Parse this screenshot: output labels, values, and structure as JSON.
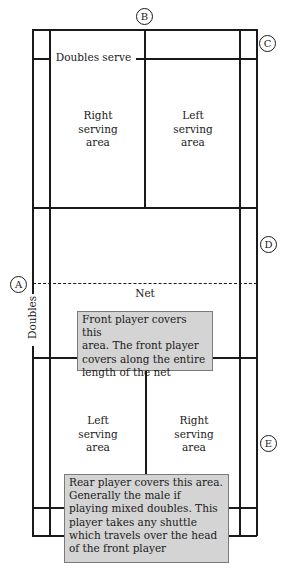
{
  "diagram": {
    "markers": [
      {
        "id": "A",
        "label": "A"
      },
      {
        "id": "B",
        "label": "B"
      },
      {
        "id": "C",
        "label": "C"
      },
      {
        "id": "D",
        "label": "D"
      },
      {
        "id": "E",
        "label": "E"
      }
    ],
    "labels": {
      "doubles_serve": "Doubles serve",
      "net": "Net",
      "doubles": "Doubles"
    },
    "top_half": {
      "right_area": "Right\nserving\narea",
      "left_area": "Left\nserving\narea"
    },
    "bottom_half": {
      "left_area": "Left\nserving\narea",
      "right_area": "Right\nserving\narea"
    },
    "notes": {
      "front": "Front player covers this\narea. The front player\ncovers along the entire\nlength of the net",
      "rear": "Rear player covers this area.\nGenerally the male if\nplaying mixed doubles. This\nplayer takes any shuttle\nwhich travels over the head\nof the front player"
    },
    "colors": {
      "line": "#1a1a1a",
      "note_fill": "#d4d4d4",
      "note_border": "#7a7a7a"
    }
  }
}
